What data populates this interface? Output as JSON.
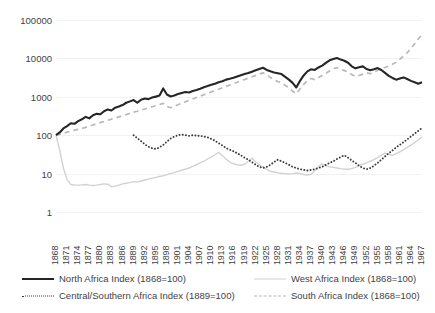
{
  "chart_data": {
    "type": "line",
    "title": "",
    "xlabel": "",
    "ylabel": "",
    "yscale": "log",
    "ylim": [
      1,
      100000
    ],
    "ytick_labels": [
      "100000",
      "10000",
      "1000",
      "100",
      "10",
      "1"
    ],
    "ytick_values": [
      100000,
      10000,
      1000,
      100,
      10,
      1
    ],
    "grid": true,
    "legend_position": "bottom",
    "x_start": 1868,
    "x_end": 1967,
    "x_tick_step": 3,
    "xtick_labels": [
      "1868",
      "1871",
      "1874",
      "1877",
      "1880",
      "1883",
      "1886",
      "1889",
      "1892",
      "1895",
      "1898",
      "1901",
      "1904",
      "1907",
      "1910",
      "1913",
      "1916",
      "1919",
      "1922",
      "1925",
      "1928",
      "1931",
      "1934",
      "1937",
      "1940",
      "1943",
      "1946",
      "1949",
      "1952",
      "1955",
      "1958",
      "1961",
      "1964",
      "1967"
    ],
    "series": [
      {
        "name": "North Africa Index (1868=100)",
        "style": "solid",
        "color": "#262626",
        "x_start": 1868,
        "values": [
          100,
          118,
          150,
          172,
          205,
          198,
          232,
          260,
          300,
          275,
          330,
          360,
          352,
          420,
          470,
          440,
          520,
          560,
          610,
          700,
          760,
          820,
          700,
          840,
          900,
          870,
          960,
          1010,
          1080,
          1650,
          1150,
          1020,
          1080,
          1180,
          1260,
          1340,
          1300,
          1420,
          1500,
          1620,
          1780,
          1900,
          2050,
          2200,
          2400,
          2550,
          2800,
          2950,
          3150,
          3400,
          3650,
          3900,
          4150,
          4500,
          4900,
          5300,
          5700,
          5000,
          4600,
          4300,
          4100,
          3900,
          3300,
          2800,
          2300,
          1750,
          2600,
          3600,
          4600,
          5200,
          5000,
          5800,
          6500,
          7600,
          8900,
          9600,
          10200,
          9300,
          8700,
          7700,
          6200,
          5500,
          5900,
          6200,
          5300,
          4900,
          5200,
          5600,
          5000,
          4200,
          3500,
          3100,
          2800,
          3000,
          3200,
          2900,
          2600,
          2400,
          2200,
          2400,
          1750
        ]
      },
      {
        "name": "West Africa Index (1868=100)",
        "style": "solid-light",
        "color": "#d2d2d2",
        "x_start": 1868,
        "values": [
          100,
          40,
          14,
          7,
          5.2,
          5.0,
          5.0,
          5.1,
          5.2,
          5.0,
          4.9,
          5.0,
          5.2,
          5.4,
          5.3,
          4.6,
          4.7,
          5.0,
          5.4,
          5.6,
          5.8,
          6.2,
          6.0,
          6.4,
          6.8,
          7.2,
          7.6,
          8.0,
          8.4,
          8.8,
          9.4,
          10.0,
          10.6,
          11.4,
          12.2,
          13.0,
          14.0,
          15.5,
          17.0,
          19.0,
          21.0,
          24.0,
          27.0,
          31.0,
          36.0,
          29.0,
          24.0,
          20.0,
          18.0,
          17.0,
          16.5,
          17.5,
          21.0,
          25.0,
          20.0,
          17.0,
          15.0,
          13.0,
          11.5,
          11.0,
          10.5,
          10.2,
          10.0,
          9.8,
          10.0,
          10.4,
          10.0,
          9.5,
          9.2,
          9.6,
          12.0,
          15.0,
          18.0,
          16.0,
          15.0,
          14.5,
          14.0,
          13.5,
          13.2,
          13.0,
          13.5,
          14.5,
          16.0,
          17.5,
          19.0,
          21.0,
          23.0,
          26.0,
          30.0,
          34.0,
          32.0,
          30.0,
          33.0,
          37.0,
          42.0,
          48.0,
          55.0,
          64.0,
          75.0,
          90.0,
          100.0
        ]
      },
      {
        "name": "Central/Southern Africa Index (1889=100)",
        "style": "dotted",
        "color": "#3a3a3a",
        "x_start": 1889,
        "values": [
          100,
          84,
          70,
          58,
          50,
          46,
          44,
          48,
          56,
          68,
          82,
          92,
          100,
          104,
          100,
          96,
          100,
          98,
          96,
          92,
          88,
          80,
          72,
          62,
          54,
          46,
          42,
          38,
          34,
          30,
          26,
          23,
          20,
          17,
          15,
          14,
          15,
          17,
          20,
          23,
          21,
          19,
          17,
          15,
          14,
          13,
          12.5,
          12,
          12.5,
          13,
          14,
          15,
          17,
          19,
          21,
          24,
          27,
          30,
          26,
          22,
          19,
          16,
          14,
          13,
          14,
          16,
          19,
          23,
          28,
          34,
          40,
          48,
          56,
          66,
          78,
          92,
          110,
          130,
          155,
          150,
          145,
          160,
          180,
          200,
          230,
          260,
          300,
          340,
          290,
          270,
          300,
          340,
          380,
          420,
          400
        ]
      },
      {
        "name": "South Africa Index (1868=100)",
        "style": "dashed",
        "color": "#b9b9b9",
        "x_start": 1868,
        "values": [
          100,
          105,
          112,
          120,
          128,
          135,
          142,
          150,
          160,
          172,
          185,
          198,
          212,
          228,
          244,
          262,
          280,
          300,
          322,
          345,
          370,
          398,
          420,
          450,
          482,
          515,
          550,
          588,
          628,
          672,
          560,
          520,
          560,
          620,
          680,
          740,
          810,
          880,
          960,
          1040,
          1130,
          1230,
          1340,
          1450,
          1580,
          1720,
          1870,
          2030,
          2210,
          2400,
          2600,
          2820,
          3060,
          3320,
          3600,
          3900,
          4200,
          3700,
          3200,
          2800,
          2500,
          2300,
          2000,
          1700,
          1400,
          1200,
          1600,
          2100,
          2600,
          3000,
          2800,
          3200,
          3600,
          4100,
          4700,
          5300,
          5800,
          5200,
          4800,
          4400,
          3800,
          3400,
          3600,
          3900,
          4200,
          4000,
          4400,
          4900,
          5400,
          5800,
          6300,
          7000,
          8000,
          9500,
          11500,
          14000,
          18000,
          24000,
          32000,
          42000,
          56000,
          66000
        ]
      }
    ]
  },
  "legend": {
    "items": [
      {
        "label": "North Africa Index (1868=100)",
        "style": "solid"
      },
      {
        "label": "West Africa Index (1868=100)",
        "style": "solid-light"
      },
      {
        "label": "Central/Southern Africa Index (1889=100)",
        "style": "dotted"
      },
      {
        "label": "South Africa Index (1868=100)",
        "style": "dashed"
      }
    ]
  }
}
